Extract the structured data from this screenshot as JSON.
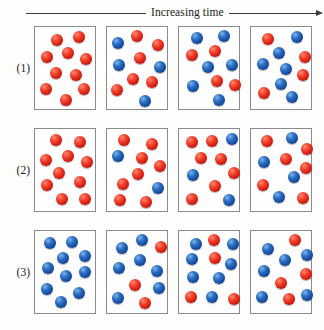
{
  "figure": {
    "axis": {
      "label": "Increasing time",
      "arrow_icon": "arrow-right-icon"
    },
    "legend": {
      "reactant_color": "#d6281b",
      "product_color": "#1c56ab"
    },
    "box_count_per_row": 4,
    "spheres_per_box": 10,
    "rows": [
      {
        "label": "(1)",
        "name": "row-1",
        "boxes": [
          {
            "name": "row1-box1",
            "red_count": 10,
            "blue_count": 0,
            "spheres": [
              {
                "x": 22,
                "y": 13,
                "color": "red"
              },
              {
                "x": 44,
                "y": 10,
                "color": "red"
              },
              {
                "x": 12,
                "y": 30,
                "color": "red"
              },
              {
                "x": 33,
                "y": 26,
                "color": "red"
              },
              {
                "x": 51,
                "y": 32,
                "color": "red"
              },
              {
                "x": 21,
                "y": 46,
                "color": "red"
              },
              {
                "x": 41,
                "y": 48,
                "color": "red"
              },
              {
                "x": 11,
                "y": 62,
                "color": "red"
              },
              {
                "x": 49,
                "y": 62,
                "color": "red"
              },
              {
                "x": 31,
                "y": 73,
                "color": "red"
              }
            ]
          },
          {
            "name": "row1-box2",
            "red_count": 5,
            "blue_count": 5,
            "spheres": [
              {
                "x": 11,
                "y": 16,
                "color": "blue"
              },
              {
                "x": 30,
                "y": 9,
                "color": "red"
              },
              {
                "x": 51,
                "y": 18,
                "color": "red"
              },
              {
                "x": 33,
                "y": 31,
                "color": "red"
              },
              {
                "x": 12,
                "y": 38,
                "color": "blue"
              },
              {
                "x": 53,
                "y": 40,
                "color": "blue"
              },
              {
                "x": 26,
                "y": 52,
                "color": "red"
              },
              {
                "x": 45,
                "y": 55,
                "color": "red"
              },
              {
                "x": 10,
                "y": 63,
                "color": "red"
              },
              {
                "x": 38,
                "y": 74,
                "color": "blue"
              }
            ]
          },
          {
            "name": "row1-box3",
            "red_count": 4,
            "blue_count": 6,
            "spheres": [
              {
                "x": 18,
                "y": 11,
                "color": "blue"
              },
              {
                "x": 45,
                "y": 9,
                "color": "blue"
              },
              {
                "x": 13,
                "y": 28,
                "color": "red"
              },
              {
                "x": 36,
                "y": 24,
                "color": "red"
              },
              {
                "x": 29,
                "y": 40,
                "color": "blue"
              },
              {
                "x": 53,
                "y": 38,
                "color": "blue"
              },
              {
                "x": 38,
                "y": 54,
                "color": "red"
              },
              {
                "x": 14,
                "y": 59,
                "color": "blue"
              },
              {
                "x": 56,
                "y": 58,
                "color": "red"
              },
              {
                "x": 40,
                "y": 73,
                "color": "blue"
              }
            ]
          },
          {
            "name": "row1-box4",
            "red_count": 4,
            "blue_count": 6,
            "spheres": [
              {
                "x": 17,
                "y": 12,
                "color": "red"
              },
              {
                "x": 46,
                "y": 10,
                "color": "blue"
              },
              {
                "x": 28,
                "y": 26,
                "color": "blue"
              },
              {
                "x": 54,
                "y": 30,
                "color": "red"
              },
              {
                "x": 12,
                "y": 37,
                "color": "blue"
              },
              {
                "x": 35,
                "y": 42,
                "color": "blue"
              },
              {
                "x": 52,
                "y": 48,
                "color": "red"
              },
              {
                "x": 30,
                "y": 57,
                "color": "blue"
              },
              {
                "x": 13,
                "y": 66,
                "color": "red"
              },
              {
                "x": 41,
                "y": 70,
                "color": "blue"
              }
            ]
          }
        ]
      },
      {
        "label": "(2)",
        "name": "row-2",
        "boxes": [
          {
            "name": "row2-box1",
            "red_count": 10,
            "blue_count": 0,
            "spheres": [
              {
                "x": 21,
                "y": 11,
                "color": "red"
              },
              {
                "x": 45,
                "y": 13,
                "color": "red"
              },
              {
                "x": 33,
                "y": 27,
                "color": "red"
              },
              {
                "x": 11,
                "y": 31,
                "color": "red"
              },
              {
                "x": 52,
                "y": 33,
                "color": "red"
              },
              {
                "x": 24,
                "y": 44,
                "color": "red"
              },
              {
                "x": 12,
                "y": 56,
                "color": "red"
              },
              {
                "x": 45,
                "y": 53,
                "color": "red"
              },
              {
                "x": 27,
                "y": 70,
                "color": "red"
              },
              {
                "x": 50,
                "y": 70,
                "color": "red"
              }
            ]
          },
          {
            "name": "row2-box2",
            "red_count": 8,
            "blue_count": 2,
            "spheres": [
              {
                "x": 17,
                "y": 11,
                "color": "red"
              },
              {
                "x": 45,
                "y": 15,
                "color": "red"
              },
              {
                "x": 11,
                "y": 27,
                "color": "blue"
              },
              {
                "x": 35,
                "y": 29,
                "color": "red"
              },
              {
                "x": 53,
                "y": 37,
                "color": "red"
              },
              {
                "x": 31,
                "y": 45,
                "color": "red"
              },
              {
                "x": 16,
                "y": 55,
                "color": "red"
              },
              {
                "x": 51,
                "y": 59,
                "color": "blue"
              },
              {
                "x": 13,
                "y": 71,
                "color": "red"
              },
              {
                "x": 39,
                "y": 73,
                "color": "red"
              }
            ]
          },
          {
            "name": "row2-box3",
            "red_count": 7,
            "blue_count": 3,
            "spheres": [
              {
                "x": 13,
                "y": 13,
                "color": "red"
              },
              {
                "x": 33,
                "y": 12,
                "color": "red"
              },
              {
                "x": 53,
                "y": 10,
                "color": "blue"
              },
              {
                "x": 22,
                "y": 29,
                "color": "red"
              },
              {
                "x": 42,
                "y": 30,
                "color": "red"
              },
              {
                "x": 14,
                "y": 46,
                "color": "blue"
              },
              {
                "x": 55,
                "y": 44,
                "color": "red"
              },
              {
                "x": 36,
                "y": 57,
                "color": "red"
              },
              {
                "x": 13,
                "y": 70,
                "color": "red"
              },
              {
                "x": 50,
                "y": 71,
                "color": "blue"
              }
            ]
          },
          {
            "name": "row2-box4",
            "red_count": 6,
            "blue_count": 4,
            "spheres": [
              {
                "x": 16,
                "y": 12,
                "color": "red"
              },
              {
                "x": 41,
                "y": 9,
                "color": "blue"
              },
              {
                "x": 56,
                "y": 20,
                "color": "red"
              },
              {
                "x": 13,
                "y": 33,
                "color": "blue"
              },
              {
                "x": 35,
                "y": 30,
                "color": "red"
              },
              {
                "x": 55,
                "y": 39,
                "color": "red"
              },
              {
                "x": 43,
                "y": 48,
                "color": "blue"
              },
              {
                "x": 12,
                "y": 56,
                "color": "red"
              },
              {
                "x": 28,
                "y": 68,
                "color": "blue"
              },
              {
                "x": 52,
                "y": 69,
                "color": "red"
              }
            ]
          }
        ]
      },
      {
        "label": "(3)",
        "name": "row-3",
        "boxes": [
          {
            "name": "row3-box1",
            "red_count": 0,
            "blue_count": 10,
            "spheres": [
              {
                "x": 15,
                "y": 12,
                "color": "blue"
              },
              {
                "x": 37,
                "y": 11,
                "color": "blue"
              },
              {
                "x": 28,
                "y": 27,
                "color": "blue"
              },
              {
                "x": 50,
                "y": 25,
                "color": "blue"
              },
              {
                "x": 13,
                "y": 37,
                "color": "blue"
              },
              {
                "x": 50,
                "y": 41,
                "color": "blue"
              },
              {
                "x": 31,
                "y": 45,
                "color": "blue"
              },
              {
                "x": 12,
                "y": 58,
                "color": "blue"
              },
              {
                "x": 44,
                "y": 62,
                "color": "blue"
              },
              {
                "x": 26,
                "y": 71,
                "color": "blue"
              }
            ]
          },
          {
            "name": "row3-box2",
            "red_count": 3,
            "blue_count": 7,
            "spheres": [
              {
                "x": 15,
                "y": 17,
                "color": "blue"
              },
              {
                "x": 35,
                "y": 9,
                "color": "blue"
              },
              {
                "x": 54,
                "y": 16,
                "color": "red"
              },
              {
                "x": 33,
                "y": 29,
                "color": "blue"
              },
              {
                "x": 12,
                "y": 37,
                "color": "blue"
              },
              {
                "x": 50,
                "y": 40,
                "color": "blue"
              },
              {
                "x": 28,
                "y": 54,
                "color": "red"
              },
              {
                "x": 52,
                "y": 57,
                "color": "blue"
              },
              {
                "x": 11,
                "y": 67,
                "color": "blue"
              },
              {
                "x": 38,
                "y": 72,
                "color": "red"
              }
            ]
          },
          {
            "name": "row3-box3",
            "red_count": 4,
            "blue_count": 6,
            "spheres": [
              {
                "x": 17,
                "y": 13,
                "color": "blue"
              },
              {
                "x": 35,
                "y": 9,
                "color": "red"
              },
              {
                "x": 54,
                "y": 13,
                "color": "blue"
              },
              {
                "x": 13,
                "y": 28,
                "color": "blue"
              },
              {
                "x": 36,
                "y": 27,
                "color": "red"
              },
              {
                "x": 52,
                "y": 33,
                "color": "blue"
              },
              {
                "x": 14,
                "y": 46,
                "color": "blue"
              },
              {
                "x": 40,
                "y": 47,
                "color": "blue"
              },
              {
                "x": 12,
                "y": 66,
                "color": "red"
              },
              {
                "x": 33,
                "y": 66,
                "color": "blue"
              },
              {
                "x": 55,
                "y": 68,
                "color": "red"
              }
            ]
          },
          {
            "name": "row3-box4",
            "red_count": 5,
            "blue_count": 5,
            "spheres": [
              {
                "x": 17,
                "y": 18,
                "color": "blue"
              },
              {
                "x": 44,
                "y": 9,
                "color": "red"
              },
              {
                "x": 56,
                "y": 24,
                "color": "blue"
              },
              {
                "x": 34,
                "y": 29,
                "color": "blue"
              },
              {
                "x": 13,
                "y": 40,
                "color": "blue"
              },
              {
                "x": 55,
                "y": 43,
                "color": "red"
              },
              {
                "x": 30,
                "y": 52,
                "color": "red"
              },
              {
                "x": 11,
                "y": 66,
                "color": "blue"
              },
              {
                "x": 38,
                "y": 68,
                "color": "red"
              },
              {
                "x": 56,
                "y": 64,
                "color": "blue"
              }
            ]
          }
        ]
      }
    ]
  }
}
